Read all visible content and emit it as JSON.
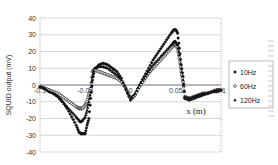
{
  "chart_data": {
    "type": "scatter",
    "title": "",
    "xlabel": "x (m)",
    "ylabel": "SQUID output (mV)",
    "xlim": [
      -0.1,
      0.1
    ],
    "ylim": [
      -40,
      40
    ],
    "x_ticks": [
      "-0.1",
      "-0.05",
      "0",
      "0.05",
      "0.1"
    ],
    "y_ticks": [
      "40",
      "30",
      "20",
      "10",
      "0",
      "-10",
      "-20",
      "-30",
      "-40"
    ],
    "grid": true,
    "legend_position": "right",
    "series": [
      {
        "name": "10Hz",
        "marker": "diamond-filled",
        "x": [
          -0.1,
          -0.095,
          -0.09,
          -0.085,
          -0.08,
          -0.075,
          -0.07,
          -0.065,
          -0.06,
          -0.057,
          -0.055,
          -0.053,
          -0.05,
          -0.048,
          -0.046,
          -0.044,
          -0.042,
          -0.04,
          -0.035,
          -0.03,
          -0.025,
          -0.02,
          -0.015,
          -0.01,
          -0.005,
          0,
          0.005,
          0.01,
          0.015,
          0.02,
          0.025,
          0.03,
          0.035,
          0.04,
          0.045,
          0.048,
          0.05,
          0.052,
          0.054,
          0.056,
          0.058,
          0.06,
          0.065,
          0.07,
          0.075,
          0.08,
          0.085,
          0.09,
          0.095,
          0.1
        ],
        "y": [
          -1,
          -2,
          -3,
          -5,
          -7,
          -10,
          -14,
          -19,
          -24,
          -28,
          -29,
          -29,
          -29,
          -24,
          -20,
          -8,
          3,
          9,
          12,
          13,
          12,
          10,
          8,
          4,
          -3,
          -9,
          -6,
          0,
          5,
          10,
          15,
          19,
          23,
          27,
          31,
          33,
          33,
          31,
          22,
          12,
          5,
          -8,
          -9,
          -8,
          -7,
          -6,
          -5,
          -4,
          -4,
          -3
        ]
      },
      {
        "name": "60Hz",
        "marker": "circle-open",
        "x": [
          -0.1,
          -0.095,
          -0.09,
          -0.085,
          -0.08,
          -0.075,
          -0.07,
          -0.065,
          -0.06,
          -0.057,
          -0.055,
          -0.053,
          -0.05,
          -0.048,
          -0.046,
          -0.044,
          -0.042,
          -0.04,
          -0.035,
          -0.03,
          -0.025,
          -0.02,
          -0.015,
          -0.01,
          -0.005,
          0,
          0.005,
          0.01,
          0.015,
          0.02,
          0.025,
          0.03,
          0.035,
          0.04,
          0.045,
          0.048,
          0.05,
          0.052,
          0.054,
          0.056,
          0.058,
          0.06,
          0.065,
          0.07,
          0.075,
          0.08,
          0.085,
          0.09,
          0.095,
          0.1
        ],
        "y": [
          -1,
          -2,
          -3,
          -4,
          -5,
          -7,
          -9,
          -11,
          -13,
          -14,
          -14,
          -14,
          -12,
          -10,
          -6,
          -2,
          8,
          9,
          8,
          7,
          6,
          5,
          4,
          2,
          -2,
          -8,
          -6,
          -1,
          3,
          7,
          10,
          13,
          16,
          19,
          22,
          24,
          24,
          22,
          16,
          8,
          2,
          -7,
          -8,
          -7,
          -6,
          -5,
          -5,
          -4,
          -3,
          -3
        ]
      },
      {
        "name": "120Hz",
        "marker": "triangle-filled",
        "x": [
          -0.1,
          -0.095,
          -0.09,
          -0.085,
          -0.08,
          -0.075,
          -0.07,
          -0.065,
          -0.06,
          -0.057,
          -0.055,
          -0.053,
          -0.05,
          -0.048,
          -0.046,
          -0.044,
          -0.042,
          -0.04,
          -0.035,
          -0.03,
          -0.025,
          -0.02,
          -0.015,
          -0.01,
          -0.005,
          0,
          0.005,
          0.01,
          0.015,
          0.02,
          0.025,
          0.03,
          0.035,
          0.04,
          0.045,
          0.048,
          0.05,
          0.052,
          0.054,
          0.056,
          0.058,
          0.06,
          0.065,
          0.07,
          0.075,
          0.08,
          0.085,
          0.09,
          0.095,
          0.1
        ],
        "y": [
          -1,
          -2,
          -4,
          -5,
          -7,
          -10,
          -13,
          -16,
          -19,
          -21,
          -22,
          -21,
          -19,
          -15,
          -10,
          -4,
          5,
          10,
          11,
          11,
          10,
          8,
          6,
          3,
          -2,
          -8,
          -5,
          0,
          4,
          8,
          12,
          15,
          18,
          21,
          24,
          26,
          26,
          24,
          18,
          10,
          3,
          -7,
          -8,
          -7,
          -6,
          -5,
          -5,
          -4,
          -3,
          -3
        ]
      }
    ]
  },
  "legend": {
    "items": [
      {
        "label": "10Hz",
        "icon": "diamond-filled"
      },
      {
        "label": "60Hz",
        "icon": "circle-open"
      },
      {
        "label": "120Hz",
        "icon": "triangle-filled"
      }
    ]
  },
  "colors": {
    "marker": "#111111",
    "grid": "#bdbdbd",
    "plot_border": "#9a9a9a"
  }
}
